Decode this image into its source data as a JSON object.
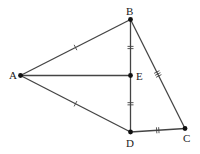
{
  "diagram": {
    "colors": {
      "line": "#444444",
      "point": "#111111",
      "label": "#222222"
    },
    "points": [
      {
        "name": "A",
        "x": 20.5,
        "y": 75.5,
        "lx": 9,
        "ly": 79
      },
      {
        "name": "B",
        "x": 130.5,
        "y": 19.5,
        "lx": 126,
        "ly": 15
      },
      {
        "name": "E",
        "x": 130.5,
        "y": 75.5,
        "lx": 136,
        "ly": 80
      },
      {
        "name": "D",
        "x": 130.5,
        "y": 132,
        "lx": 126,
        "ly": 147
      },
      {
        "name": "C",
        "x": 185,
        "y": 128.5,
        "lx": 183,
        "ly": 142
      }
    ],
    "segments": [
      {
        "from": "A",
        "to": "B",
        "ticks": 1
      },
      {
        "from": "A",
        "to": "D",
        "ticks": 1
      },
      {
        "from": "A",
        "to": "E",
        "ticks": 0
      },
      {
        "from": "B",
        "to": "E",
        "ticks": 2
      },
      {
        "from": "E",
        "to": "D",
        "ticks": 2
      },
      {
        "from": "B",
        "to": "C",
        "ticks": 3
      },
      {
        "from": "D",
        "to": "C",
        "ticks": 2
      }
    ]
  }
}
